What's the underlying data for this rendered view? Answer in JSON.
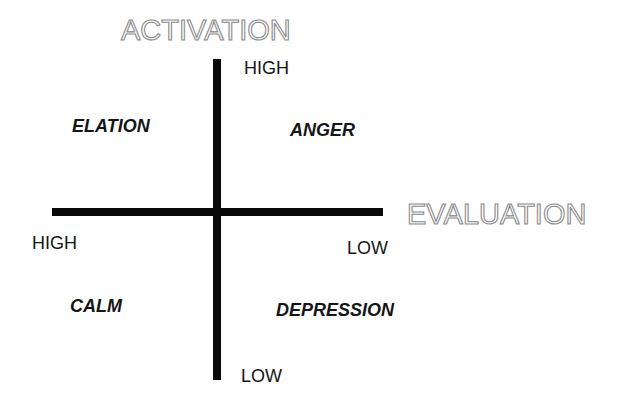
{
  "diagram": {
    "type": "two-dimensional emotion space",
    "axes": {
      "vertical": {
        "title": "ACTIVATION",
        "high_label": "HIGH",
        "low_label": "LOW"
      },
      "horizontal": {
        "title": "EVALUATION",
        "high_label": "HIGH",
        "low_label": "LOW"
      }
    },
    "quadrants": {
      "top_left": "ELATION",
      "top_right": "ANGER",
      "bottom_left": "CALM",
      "bottom_right": "DEPRESSION"
    },
    "colors": {
      "axis_line": "#0a0a0a",
      "title_outline": "#8a8a8a",
      "text": "#151515",
      "background": "#ffffff"
    }
  }
}
